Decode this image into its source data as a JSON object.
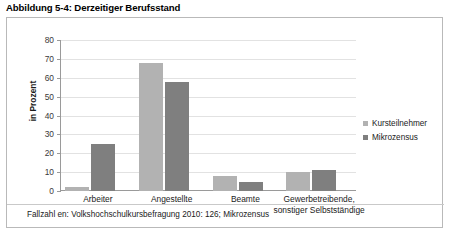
{
  "figure": {
    "title": "Abbildung 5-4: Derzeitiger Berufsstand",
    "footer_note": "Fallzahl en: Volkshochschulkursbefragung  2010: 126; Mikrozensus"
  },
  "legend": {
    "position": "right",
    "items": [
      {
        "label": "Kursteilnehmer",
        "color": "#b2b2b2"
      },
      {
        "label": "Mikrozensus",
        "color": "#7f7f7f"
      }
    ]
  },
  "chart_data": {
    "type": "bar",
    "title": "Abbildung 5-4: Derzeitiger Berufsstand",
    "xlabel": "",
    "ylabel": "in Prozent",
    "ylim": [
      0,
      80
    ],
    "ytick_step": 10,
    "yticks": [
      0,
      10,
      20,
      30,
      40,
      50,
      60,
      70,
      80
    ],
    "ytick_labels": [
      "0",
      "10",
      "20",
      "30",
      "40",
      "50",
      "60",
      "70",
      "80"
    ],
    "grid": true,
    "grid_axis": "y",
    "legend_position": "right",
    "categories": [
      "Arbeiter",
      "Angestellte",
      "Beamte",
      "Gewerbetreibende, sonstiger Selbstständige"
    ],
    "category_lines": [
      [
        "Arbeiter"
      ],
      [
        "Angestellte"
      ],
      [
        "Beamte"
      ],
      [
        "Gewerbetreibende,",
        "sonstiger Selbstständige"
      ]
    ],
    "series": [
      {
        "name": "Kursteilnehmer",
        "color": "#b2b2b2",
        "values": [
          2,
          68,
          8,
          10
        ]
      },
      {
        "name": "Mikrozensus",
        "color": "#7f7f7f",
        "values": [
          25,
          58,
          5,
          11
        ]
      }
    ]
  }
}
